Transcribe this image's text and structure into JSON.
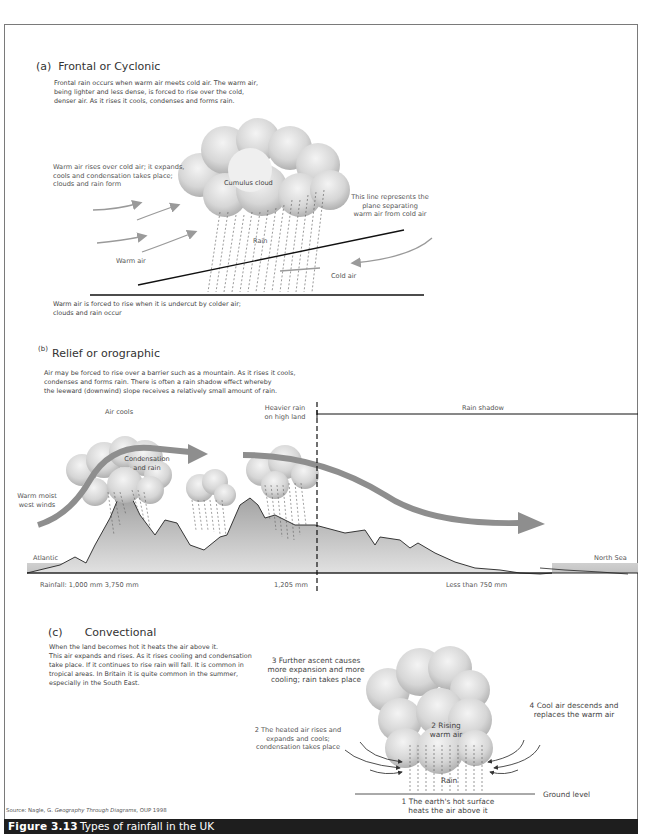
{
  "figure": {
    "number": "Figure 3.13",
    "title": "Types of rainfall in the UK",
    "source_prefix": "Source: Nagle, G. ",
    "source_book": "Geography Through Diagrams",
    "source_suffix": ", OUP 1998"
  },
  "frontal": {
    "letter": "(a)",
    "title": "Frontal or Cyclonic",
    "description": [
      "Frontal rain occurs when warm air meets cold air. The warm air,",
      "being lighter and less dense, is forced to rise over the cold,",
      "denser air. As it rises it cools, condenses and forms rain."
    ],
    "labels": {
      "warm_rises": [
        "Warm air rises over cold air; it expands,",
        "cools and condensation takes place;",
        "clouds and rain form"
      ],
      "cloud": "Cumulus cloud",
      "rain": "Rain",
      "warm_air": "Warm air",
      "cold_air": "Cold air",
      "plane": [
        "This line represents the",
        "plane separating",
        "warm air from cold air"
      ]
    },
    "footer": [
      "Warm air is forced to rise when it is undercut by colder air;",
      "clouds and rain occur"
    ]
  },
  "relief": {
    "letter": "(b)",
    "title": "Relief or orographic",
    "description": [
      "Air may be forced to rise over a barrier such as a mountain. As it rises it cools,",
      "condenses and forms rain. There is often a rain shadow effect whereby",
      "the leeward (downwind) slope receives a relatively small amount of rain."
    ],
    "labels": {
      "air_cools": "Air cools",
      "heavier_rain": [
        "Heavier rain",
        "on high land"
      ],
      "rain_shadow": "Rain shadow",
      "condensation": [
        "Condensation",
        "and rain"
      ],
      "warm_moist": [
        "Warm moist",
        "west winds"
      ],
      "atlantic": "Atlantic",
      "north_sea": "North Sea",
      "rainfall_west": "Rainfall: 1,000 mm 3,750 mm",
      "rainfall_mid": "1,205 mm",
      "rainfall_east": "Less than 750 mm"
    }
  },
  "convectional": {
    "letter": "(c)",
    "title": "Convectional",
    "description": [
      "When the land becomes hot it heats the air above it.",
      "This air expands and rises. As it rises cooling and condensation",
      "take place. If it continues to rise rain will fall. It is common in",
      "tropical areas. In Britain it is quite common in the summer,",
      "especially in the South East."
    ],
    "labels": {
      "step1": [
        "1 The earth's hot surface",
        "heats the air above it"
      ],
      "step2_left": [
        "2 The heated air rises and",
        "expands and cools;",
        "condensation takes place"
      ],
      "step2_cloud": [
        "2 Rising",
        "warm air"
      ],
      "step3": [
        "3 Further ascent causes",
        "more expansion and more",
        "cooling; rain takes place"
      ],
      "step4": [
        "4 Cool air descends and",
        "replaces the warm air"
      ],
      "rain": "Rain",
      "ground": "Ground level"
    }
  },
  "colors": {
    "frame": "#7a7a7a",
    "arrow_grey": "#9a9a9a",
    "relief_arrow": "#8e8e8e",
    "caption_bg": "#1e1e1e",
    "land_fill": "#bdbdbd"
  }
}
